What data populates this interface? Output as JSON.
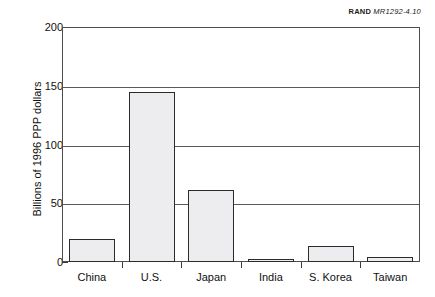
{
  "credit": {
    "brand": "RAND",
    "code": "MR1292-4.10"
  },
  "chart_data": {
    "type": "bar",
    "title": "",
    "subtitle": "",
    "xlabel": "",
    "ylabel": "Billions of 1996 PPP dollars",
    "categories": [
      "China",
      "U.S.",
      "Japan",
      "India",
      "S. Korea",
      "Taiwan"
    ],
    "values": [
      20,
      145,
      61,
      2,
      14,
      4
    ],
    "series": [
      {
        "name": "Defense spending",
        "values": [
          20,
          145,
          61,
          2,
          14,
          4
        ]
      }
    ],
    "ylim": [
      0,
      200
    ],
    "yticks": [
      0,
      50,
      100,
      150,
      200
    ],
    "ytick_labels": [
      "0",
      "50",
      "100",
      "150",
      "200"
    ],
    "grid": "horizontal",
    "legend": "none",
    "bar_fill_color": "#ededef",
    "bar_edge_color": "#2b2b2b",
    "axis_color": "#4d4d4d",
    "background_color": "#ffffff"
  }
}
